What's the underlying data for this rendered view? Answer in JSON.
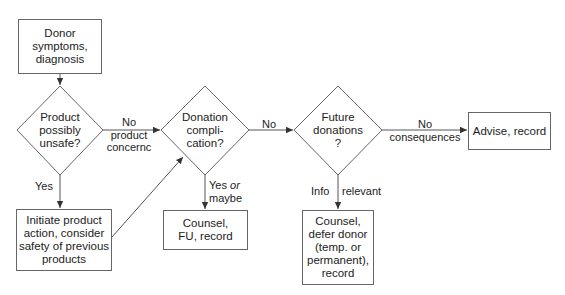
{
  "diagram": {
    "type": "flowchart",
    "nodes": [
      {
        "id": "symptoms",
        "shape": "box",
        "text": "Donor symptoms, diagnosis",
        "lines": [
          "Donor",
          "symptoms,",
          "diagnosis"
        ]
      },
      {
        "id": "product_unsafe",
        "shape": "diamond",
        "text": "Product possibly unsafe?",
        "lines": [
          "Product",
          "possibly",
          "unsafe?"
        ]
      },
      {
        "id": "product_action",
        "shape": "box",
        "text": "Initiate product action, consider safety of previous products",
        "lines": [
          "Initiate product",
          "action, consider",
          "safety of previous",
          "products"
        ]
      },
      {
        "id": "complication",
        "shape": "diamond",
        "text": "Donation compli-cation?",
        "lines": [
          "Donation",
          "compli-",
          "cation?"
        ]
      },
      {
        "id": "counsel_fu",
        "shape": "box",
        "text": "Counsel, FU, record",
        "lines": [
          "Counsel,",
          "FU, record"
        ]
      },
      {
        "id": "future_donations",
        "shape": "diamond",
        "text": "Future donations ?",
        "lines": [
          "Future",
          "donations",
          "?"
        ]
      },
      {
        "id": "counsel_defer",
        "shape": "box",
        "text": "Counsel, defer donor (temp. or permanent), record",
        "lines": [
          "Counsel,",
          "defer donor",
          "(temp. or",
          "permanent),",
          "record"
        ]
      },
      {
        "id": "advise",
        "shape": "box",
        "text": "Advise, record",
        "lines": [
          "Advise, record"
        ]
      }
    ],
    "edges": [
      {
        "from": "symptoms",
        "to": "product_unsafe",
        "label": ""
      },
      {
        "from": "product_unsafe",
        "to": "complication",
        "label": "No product concernc",
        "label_lines": [
          "No",
          "product",
          "concernc"
        ]
      },
      {
        "from": "product_unsafe",
        "to": "product_action",
        "label": "Yes"
      },
      {
        "from": "product_action",
        "to": "complication",
        "label": ""
      },
      {
        "from": "complication",
        "to": "future_donations",
        "label": "No"
      },
      {
        "from": "complication",
        "to": "counsel_fu",
        "label": "Yes or maybe",
        "label_parts": {
          "yes": "Yes",
          "or": "or",
          "maybe": "maybe"
        }
      },
      {
        "from": "future_donations",
        "to": "advise",
        "label": "No consequences",
        "label_lines": [
          "No",
          "consequences"
        ]
      },
      {
        "from": "future_donations",
        "to": "counsel_defer",
        "label": "Info relevant",
        "label_parts": {
          "left": "Info",
          "right": "relevant"
        }
      }
    ]
  },
  "colors": {
    "line": "#555555",
    "text": "#222222",
    "background": "#ffffff"
  }
}
